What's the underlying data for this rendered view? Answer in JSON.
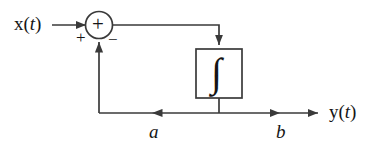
{
  "diagram": {
    "type": "control-system-block-diagram",
    "background_color": "#ffffff",
    "line_color": "#3a3a3a",
    "text_color": "#151515",
    "input": {
      "label_var": "x",
      "label_open": "(",
      "label_arg": "t",
      "label_close": ")",
      "full_label": "x(t)"
    },
    "output": {
      "label_var": "y",
      "label_open": "(",
      "label_arg": "t",
      "label_close": ")",
      "full_label": "y(t)"
    },
    "summing_junction": {
      "name": "summer",
      "symbol": "+",
      "input_sign_left": "+",
      "input_sign_bottom": "−"
    },
    "integrator_block": {
      "name": "integrator",
      "symbol": "∫"
    },
    "feedback_gain": {
      "label": "a"
    },
    "output_gain": {
      "label": "b"
    }
  }
}
